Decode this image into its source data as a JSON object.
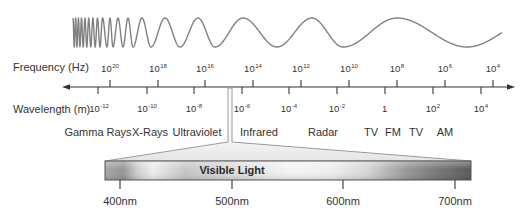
{
  "axes": {
    "frequency": {
      "label": "Frequency (Hz)",
      "ticks": [
        {
          "base": "10",
          "exp": "20"
        },
        {
          "base": "10",
          "exp": "18"
        },
        {
          "base": "10",
          "exp": "16"
        },
        {
          "base": "10",
          "exp": "14"
        },
        {
          "base": "10",
          "exp": "12"
        },
        {
          "base": "10",
          "exp": "10"
        },
        {
          "base": "10",
          "exp": "8"
        },
        {
          "base": "10",
          "exp": "6"
        },
        {
          "base": "10",
          "exp": "4"
        }
      ]
    },
    "wavelength": {
      "label": "Wavelength (m)",
      "ticks": [
        {
          "base": "10",
          "exp": "-12"
        },
        {
          "base": "10",
          "exp": "-10"
        },
        {
          "base": "10",
          "exp": "-8"
        },
        {
          "base": "10",
          "exp": "-6"
        },
        {
          "base": "10",
          "exp": "-4"
        },
        {
          "base": "10",
          "exp": "-2"
        },
        {
          "base": "1",
          "exp": ""
        },
        {
          "base": "10",
          "exp": "2"
        },
        {
          "base": "10",
          "exp": "4"
        }
      ]
    }
  },
  "bands": [
    "Gamma Rays",
    "X-Rays",
    "Ultraviolet",
    "Infrared",
    "Radar",
    "TV",
    "FM",
    "TV",
    "AM"
  ],
  "visible_light": {
    "label": "Visible Light",
    "ticks": [
      "400nm",
      "500nm",
      "600nm",
      "700nm"
    ]
  },
  "colors": {
    "text": "#333333",
    "wave": "#808080",
    "axis": "#333333",
    "bar_border": "#555555"
  }
}
